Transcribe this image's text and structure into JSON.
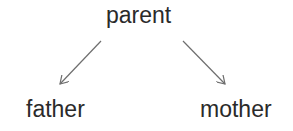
{
  "diagram": {
    "type": "tree",
    "nodes": [
      {
        "id": "parent",
        "label": "parent"
      },
      {
        "id": "father",
        "label": "father"
      },
      {
        "id": "mother",
        "label": "mother"
      }
    ],
    "edges": [
      {
        "from": "parent",
        "to": "father",
        "style": "arrow"
      },
      {
        "from": "parent",
        "to": "mother",
        "style": "arrow"
      }
    ],
    "colors": {
      "text": "#2a2a2a",
      "edge": "#6e6e6e",
      "background": "#ffffff"
    }
  }
}
